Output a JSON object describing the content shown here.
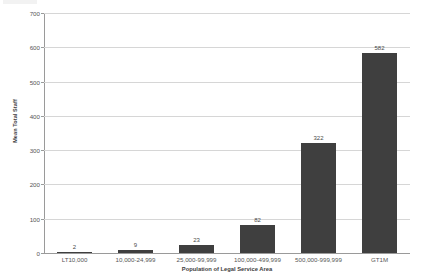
{
  "chart_data": {
    "type": "bar",
    "title": "",
    "xlabel": "Population of Legal Service Area",
    "ylabel": "Mean Total Staff",
    "categories": [
      "LT10,000",
      "10,000-24,999",
      "25,000-99,999",
      "100,000-499,999",
      "500,000-999,999",
      "GT1M"
    ],
    "values": [
      2,
      9,
      23,
      82,
      322,
      582
    ],
    "data_labels": [
      "2",
      "9",
      "23",
      "82",
      "322",
      "582"
    ],
    "ylim": [
      0,
      700
    ],
    "ytick_values": [
      0,
      100,
      200,
      300,
      400,
      500,
      600,
      700
    ],
    "ytick_labels": [
      "0",
      "100",
      "200",
      "300",
      "400",
      "500",
      "600",
      "700"
    ],
    "grid": true,
    "legend": false,
    "series": [
      {
        "name": "Mean Total Staff",
        "values": [
          2,
          9,
          23,
          82,
          322,
          582
        ],
        "color": "#3f3f3f"
      }
    ]
  },
  "colors": {
    "bar": "#3f3f3f",
    "gridline": "#d6d6d6",
    "axis": "#9a9a9a",
    "background": "#ffffff",
    "text": "#565656"
  }
}
